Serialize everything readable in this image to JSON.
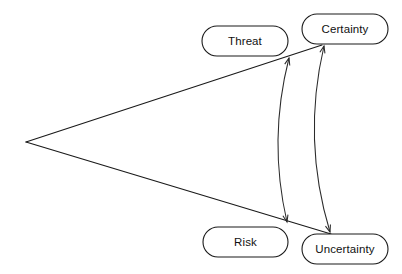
{
  "diagram": {
    "type": "concept-relationship-diagram",
    "background_color": "#ffffff",
    "line_color": "#1a1a1a",
    "node_fill_color": "#ffffff",
    "text_color": "#111111",
    "nodes": [
      {
        "id": "threat",
        "label": "Threat",
        "shape": "stadium",
        "x": 202,
        "y": 26,
        "width": 86,
        "height": 30,
        "cx": 245,
        "cy": 41
      },
      {
        "id": "certainty",
        "label": "Certainty",
        "shape": "stadium",
        "x": 302,
        "y": 14,
        "width": 86,
        "height": 30,
        "cx": 345,
        "cy": 29
      },
      {
        "id": "risk",
        "label": "Risk",
        "shape": "stadium",
        "x": 203,
        "y": 227,
        "width": 85,
        "height": 30,
        "cx": 245.5,
        "cy": 242
      },
      {
        "id": "uncertainty",
        "label": "Uncertainty",
        "shape": "stadium",
        "x": 302,
        "y": 234,
        "width": 86,
        "height": 30,
        "cx": 345,
        "cy": 249
      }
    ],
    "wedge": {
      "description": "open wedge with apex at left fanning out to the right",
      "apex_x": 26,
      "apex_y": 142,
      "upper_end_x": 322,
      "upper_end_y": 45,
      "lower_end_x": 331,
      "lower_end_y": 234
    },
    "curved_arrows": [
      {
        "id": "inner-curve",
        "style": "double-headed",
        "bulge": "left",
        "start_x": 289,
        "start_y": 58,
        "end_x": 287,
        "end_y": 222,
        "control_x": 268,
        "control_y": 140
      },
      {
        "id": "outer-curve",
        "style": "double-headed",
        "bulge": "left",
        "start_x": 324,
        "start_y": 46,
        "end_x": 330,
        "end_y": 232,
        "control_x": 302,
        "control_y": 140
      }
    ]
  }
}
